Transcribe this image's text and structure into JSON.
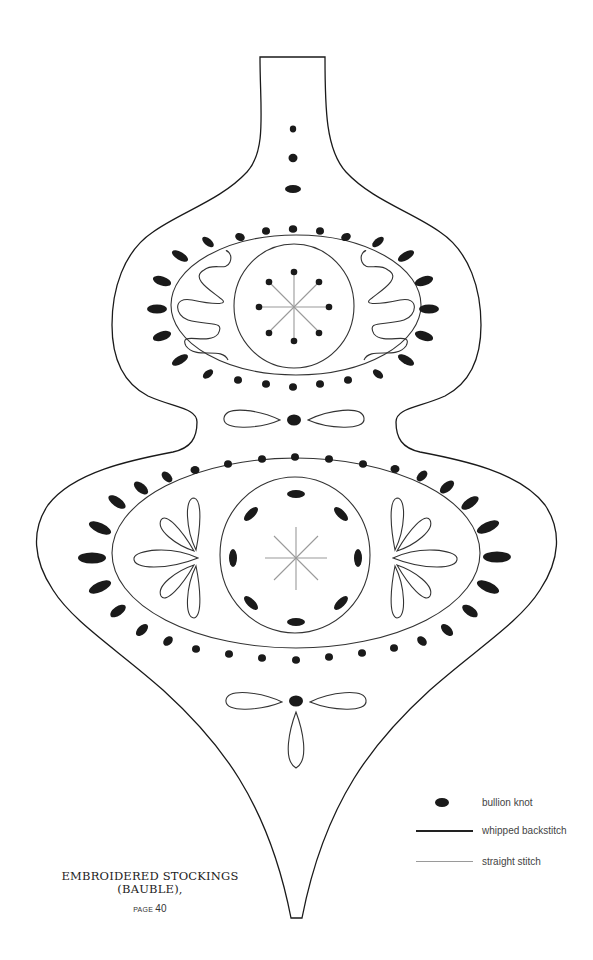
{
  "pattern": {
    "title_line1": "EMBROIDERED STOCKINGS",
    "title_line2": "(BAUBLE),",
    "page_label": "PAGE",
    "page_number": "40"
  },
  "legend": {
    "items": [
      {
        "symbol": "bullion-knot",
        "label": "bullion knot"
      },
      {
        "symbol": "whipped-backstitch-line",
        "label": "whipped backstitch"
      },
      {
        "symbol": "straight-stitch-line",
        "label": "straight stitch"
      }
    ]
  },
  "colors": {
    "outline": "#1a1a1a",
    "whipped_backstitch": "#333333",
    "straight_stitch": "#9a9a9a",
    "bullion_knot": "#1a1a1a",
    "background": "#ffffff"
  }
}
